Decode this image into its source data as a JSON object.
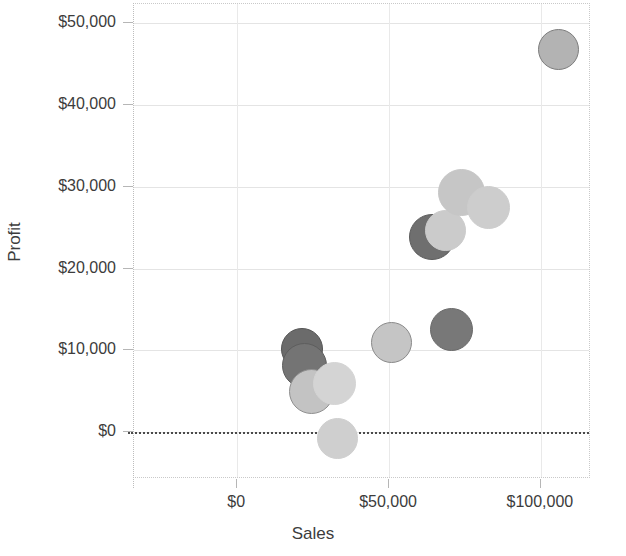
{
  "chart_data": {
    "type": "scatter",
    "title": "",
    "xlabel": "Sales",
    "ylabel": "Profit",
    "xlim": [
      -34000,
      116500
    ],
    "ylim": [
      -5700,
      52300
    ],
    "grid": true,
    "legend": "none",
    "x_ticks": [
      {
        "value": 0,
        "label": "$0"
      },
      {
        "value": 50000,
        "label": "$50,000"
      },
      {
        "value": 100000,
        "label": "$100,000"
      }
    ],
    "y_ticks": [
      {
        "value": 0,
        "label": "$0"
      },
      {
        "value": 10000,
        "label": "$10,000"
      },
      {
        "value": 20000,
        "label": "$20,000"
      },
      {
        "value": 30000,
        "label": "$30,000"
      },
      {
        "value": 40000,
        "label": "$40,000"
      },
      {
        "value": 50000,
        "label": "$50,000"
      }
    ],
    "reference_line": {
      "axis": "y",
      "value": 0,
      "style": "dotted",
      "color": "#4a4a4a"
    },
    "points": [
      {
        "x": 21200,
        "y": 10200,
        "size_px": 42,
        "color": "#6b6b6b",
        "stroke": "#555555"
      },
      {
        "x": 22300,
        "y": 8200,
        "size_px": 45,
        "color": "#747474",
        "stroke": "#5e5e5e"
      },
      {
        "x": 24300,
        "y": 5000,
        "size_px": 45,
        "color": "#c3c3c3",
        "stroke": "#8f8f8f"
      },
      {
        "x": 32000,
        "y": 6000,
        "size_px": 43,
        "color": "#d4d4d4",
        "stroke": "#d4d4d4"
      },
      {
        "x": 33000,
        "y": -800,
        "size_px": 41,
        "color": "#cfcfcf",
        "stroke": "#cfcfcf"
      },
      {
        "x": 50800,
        "y": 11000,
        "size_px": 41,
        "color": "#c5c5c5",
        "stroke": "#8a8a8a"
      },
      {
        "x": 70400,
        "y": 12600,
        "size_px": 43,
        "color": "#787878",
        "stroke": "#6a6a6a"
      },
      {
        "x": 64000,
        "y": 23800,
        "size_px": 46,
        "color": "#6f6f6f",
        "stroke": "#5c5c5c"
      },
      {
        "x": 68600,
        "y": 24600,
        "size_px": 41,
        "color": "#cbcbcb",
        "stroke": "#cbcbcb"
      },
      {
        "x": 74000,
        "y": 29300,
        "size_px": 47,
        "color": "#c6c6c6",
        "stroke": "#c6c6c6"
      },
      {
        "x": 82600,
        "y": 27500,
        "size_px": 43,
        "color": "#cdcdcd",
        "stroke": "#cdcdcd"
      },
      {
        "x": 105900,
        "y": 46700,
        "size_px": 41,
        "color": "#b3b3b3",
        "stroke": "#7d7d7d"
      }
    ]
  },
  "axes": {
    "x_title": "Sales",
    "y_title": "Profit"
  }
}
